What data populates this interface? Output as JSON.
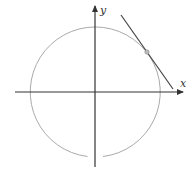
{
  "diagram": {
    "title": "",
    "type": "unit-circle-with-tangent-line",
    "axes": {
      "x_label": "x",
      "y_label": "y"
    },
    "circle": {
      "center": [
        0,
        0
      ],
      "stroke_color": "#aaaaaa"
    },
    "tangent_line": {
      "stroke_color": "#444444"
    },
    "tangent_point": {
      "fill_color": "#bbbbbb",
      "stroke_color": "#888888"
    },
    "colors": {
      "axis": "#333333",
      "circle": "#aaaaaa",
      "tangent": "#444444",
      "point": "#bbbbbb"
    }
  }
}
